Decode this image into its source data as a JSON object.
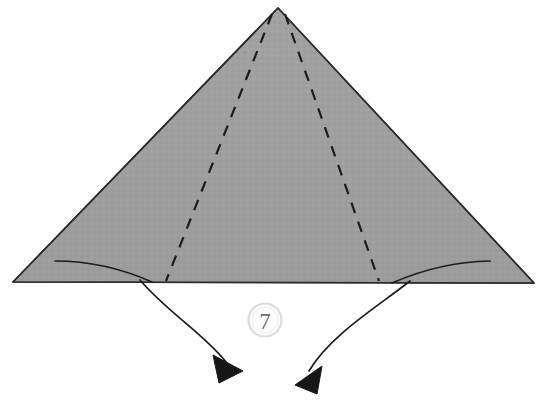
{
  "diagram": {
    "type": "origami-fold-instruction",
    "canvas": {
      "width": 542,
      "height": 412,
      "background": "#ffffff"
    },
    "step": {
      "number": "7",
      "badge_center": {
        "x": 265,
        "y": 320
      },
      "badge_radius": 16,
      "badge_fill": "#fbfbfb",
      "badge_stroke": "#d8d8d8",
      "badge_text_color": "#6f6f6f"
    },
    "shapes": {
      "main_triangle": {
        "name": "folded-paper-triangle",
        "fill": "#9e9e9e",
        "stroke": "#2a2a2a",
        "stroke_width": 1.6,
        "apex": {
          "x": 278,
          "y": 8
        },
        "left_corner": {
          "x": 13,
          "y": 282
        },
        "right_corner": {
          "x": 534,
          "y": 283
        },
        "points": "278,8 534,283 13,282"
      }
    },
    "fold_lines": [
      {
        "name": "left-valley-fold-line",
        "style": "dashed",
        "color": "#1c1c1c",
        "width": 2.2,
        "dash": "11 9",
        "from": {
          "x": 272,
          "y": 14
        },
        "to": {
          "x": 166,
          "y": 281
        }
      },
      {
        "name": "right-valley-fold-line",
        "style": "dashed",
        "color": "#1c1c1c",
        "width": 2.2,
        "dash": "11 9",
        "from": {
          "x": 285,
          "y": 14
        },
        "to": {
          "x": 379,
          "y": 281
        }
      }
    ],
    "edge_curves": [
      {
        "name": "left-flap-edge-curve",
        "color": "#1c1c1c",
        "width": 1.7,
        "path": "M 55,261 Q 105,261 152,282"
      },
      {
        "name": "right-flap-edge-curve",
        "color": "#1c1c1c",
        "width": 1.7,
        "path": "M 490,261 Q 440,262 392,283"
      }
    ],
    "arrows": [
      {
        "name": "left-fold-arrow",
        "color": "#1c1c1c",
        "width": 1.7,
        "path": "M 140,280 C 165,310 205,335 226,362",
        "arrowhead": {
          "points": "213,355 243,371 219,383",
          "fill": "#171717"
        }
      },
      {
        "name": "right-fold-arrow",
        "color": "#1c1c1c",
        "width": 1.7,
        "path": "M 410,281 C 380,305 330,335 309,371",
        "arrowhead": {
          "points": "322,366 295,385 317,394",
          "fill": "#171717"
        }
      }
    ],
    "colors": {
      "paper_gray": "#9e9e9e",
      "ink_black": "#1c1c1c",
      "background_white": "#ffffff",
      "badge_gray": "#6f6f6f"
    }
  }
}
